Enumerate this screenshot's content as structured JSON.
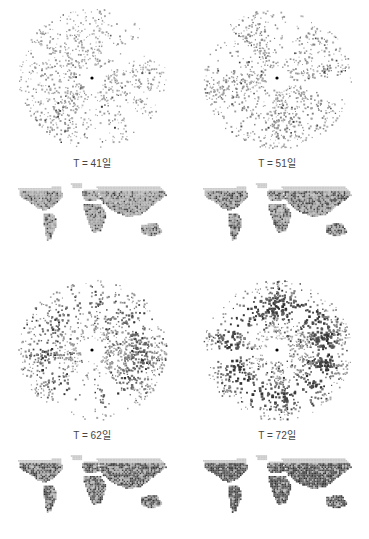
{
  "figure": {
    "panels": [
      {
        "id": "t41",
        "label": "T = 41일",
        "density": 0.25,
        "ring": 0.0,
        "dark": 0.15,
        "map_dark": 0.2
      },
      {
        "id": "t51",
        "label": "T = 51일",
        "density": 0.32,
        "ring": 0.1,
        "dark": 0.3,
        "map_dark": 0.35
      },
      {
        "id": "t62",
        "label": "T = 62일",
        "density": 0.42,
        "ring": 0.35,
        "dark": 0.55,
        "map_dark": 0.55
      },
      {
        "id": "t72",
        "label": "T = 72일",
        "density": 0.5,
        "ring": 0.6,
        "dark": 0.75,
        "map_dark": 0.75
      }
    ]
  },
  "colors": {
    "light": "#c8c8c8",
    "mid": "#8a8a8a",
    "dark": "#3a3a3a",
    "center": "#000000"
  }
}
